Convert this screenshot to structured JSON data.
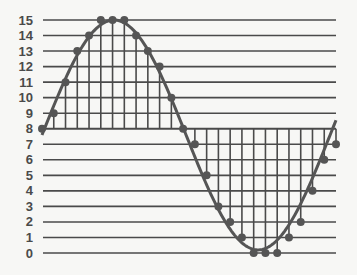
{
  "chart_data": {
    "type": "line",
    "title": "",
    "xlabel": "",
    "ylabel": "",
    "x": [
      0,
      1,
      2,
      3,
      4,
      5,
      6,
      7,
      8,
      9,
      10,
      11,
      12,
      13,
      14,
      15,
      16,
      17,
      18,
      19,
      20,
      21,
      22,
      23,
      24,
      25
    ],
    "series": [
      {
        "name": "samples",
        "values": [
          8,
          9,
          11,
          13,
          14,
          15,
          15,
          15,
          14,
          13,
          12,
          10,
          8,
          7,
          5,
          3,
          2,
          1,
          0,
          0,
          0,
          1,
          2,
          4,
          6,
          7
        ]
      }
    ],
    "y_ticks": [
      "0",
      "1",
      "2",
      "3",
      "4",
      "5",
      "6",
      "7",
      "8",
      "9",
      "10",
      "11",
      "12",
      "13",
      "14",
      "15"
    ],
    "ylim": [
      0,
      15
    ],
    "midline": 8,
    "grid": {
      "horizontal": true,
      "vertical_sample_lines": true
    },
    "legend": null
  },
  "colors": {
    "line": "#555555",
    "grid": "#4a4a4a",
    "background": "#f7f7f5",
    "tick_text": "#4a4a4a"
  }
}
